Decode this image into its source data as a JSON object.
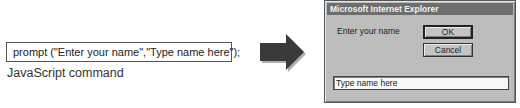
{
  "left_panel": {
    "command_text": "prompt (\"Enter your name\",\"Type name here\");",
    "caption": "JavaScript command"
  },
  "arrow": {
    "icon": "arrow-right-icon",
    "color": "#3a3a3a"
  },
  "dialog": {
    "title": "Microsoft Internet Explorer",
    "prompt_label": "Enter your name",
    "ok_label": "OK",
    "cancel_label": "Cancel",
    "input_value": "Type name here",
    "colors": {
      "body": "#bdbdbd",
      "titlebar": "#6e6e6e"
    }
  }
}
